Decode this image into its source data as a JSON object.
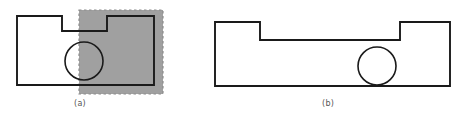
{
  "figure": {
    "background_color": "#ffffff",
    "stroke_color": "#1a1a1a",
    "selection_fill_color": "#a0a0a0",
    "selection_border_color": "#8c8c8c",
    "caption_color": "#555555",
    "panels": [
      {
        "id": "panel-a",
        "caption": "(a)",
        "caption_position": {
          "x": 74,
          "y": 99
        },
        "part_outline": {
          "name": "notched-plate-outline",
          "points": "17,16 62,16 62,31 107,31 107,16 154,16 154,85 17,85",
          "closed": true,
          "stroke_width": 1.9,
          "fill": "none"
        },
        "hole": {
          "name": "circular-hole",
          "cx": 84,
          "cy": 61,
          "r": 19,
          "stroke_width": 1.6,
          "fill": "none"
        },
        "selection_box": {
          "name": "selection-region",
          "x": 79,
          "y": 10,
          "width": 84,
          "height": 84,
          "dash": "2.5,2.5",
          "stroke_width": 1.2
        }
      },
      {
        "id": "panel-b",
        "caption": "(b)",
        "caption_position": {
          "x": 322,
          "y": 99
        },
        "part_outline": {
          "name": "stepped-plate-outline",
          "points": "215,22 260,22 260,40 400,40 400,22 450,22 450,86 215,86",
          "closed": true,
          "stroke_width": 1.9,
          "fill": "none"
        },
        "hole": {
          "name": "circular-hole",
          "cx": 377,
          "cy": 66,
          "r": 19,
          "stroke_width": 1.6,
          "fill": "none"
        },
        "selection_box": null
      }
    ]
  }
}
